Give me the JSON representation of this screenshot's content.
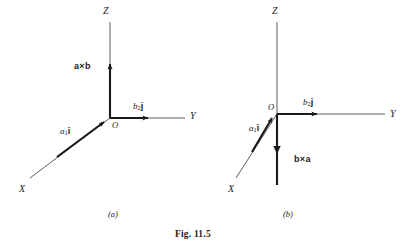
{
  "figure": {
    "caption": "Fig. 11.5",
    "caption_pos": {
      "x": 175,
      "y": 232
    },
    "panels": [
      {
        "id": "a",
        "label": "(a)",
        "label_pos": {
          "x": 108,
          "y": 210
        },
        "origin": {
          "x": 110,
          "y": 118
        },
        "origin_label": "O",
        "origin_label_pos": {
          "x": 112,
          "y": 121
        },
        "axes": [
          {
            "name": "z-axis",
            "label": "Z",
            "label_pos": {
              "x": 103,
              "y": 6
            },
            "line": {
              "x1": 110,
              "y1": 118,
              "x2": 110,
              "y2": 22
            }
          },
          {
            "name": "y-axis",
            "label": "Y",
            "label_pos": {
              "x": 190,
              "y": 111
            },
            "line": {
              "x1": 110,
              "y1": 118,
              "x2": 185,
              "y2": 118
            }
          },
          {
            "name": "x-axis",
            "label": "X",
            "label_pos": {
              "x": 19,
              "y": 184
            },
            "line": {
              "x1": 110,
              "y1": 118,
              "x2": 30,
              "y2": 178
            }
          }
        ],
        "vectors": [
          {
            "name": "a-cross-b",
            "label": "a×b",
            "label_text": "a",
            "label_op": "×",
            "label_text2": "b",
            "label_pos": {
              "x": 74,
              "y": 62
            },
            "line": {
              "x1": 110,
              "y1": 118,
              "x2": 110,
              "y2": 60
            },
            "direction": "up"
          },
          {
            "name": "a1i-component",
            "label": "a₁i",
            "coef": "a",
            "sub": "1",
            "unit": "i",
            "label_pos": {
              "x": 60,
              "y": 127
            },
            "line": {
              "x1": 110,
              "y1": 118,
              "x2": 57,
              "y2": 157
            },
            "direction": "down-left"
          },
          {
            "name": "b2j-component",
            "label": "b₂j",
            "coef": "b",
            "sub": "2",
            "unit": "j",
            "label_pos": {
              "x": 133,
              "y": 102
            },
            "line": {
              "x1": 110,
              "y1": 118,
              "x2": 152,
              "y2": 118
            },
            "direction": "right"
          }
        ]
      },
      {
        "id": "b",
        "label": "(b)",
        "label_pos": {
          "x": 283,
          "y": 210
        },
        "origin": {
          "x": 277,
          "y": 114
        },
        "origin_label": "O",
        "origin_label_pos": {
          "x": 270,
          "y": 104
        },
        "axes": [
          {
            "name": "z-axis",
            "label": "Z",
            "label_pos": {
              "x": 272,
              "y": 6
            },
            "line": {
              "x1": 277,
              "y1": 114,
              "x2": 277,
              "y2": 22
            }
          },
          {
            "name": "y-axis",
            "label": "Y",
            "label_pos": {
              "x": 390,
              "y": 109
            },
            "line": {
              "x1": 277,
              "y1": 114,
              "x2": 385,
              "y2": 114
            }
          },
          {
            "name": "x-axis",
            "label": "X",
            "label_pos": {
              "x": 228,
              "y": 184
            },
            "line": {
              "x1": 277,
              "y1": 114,
              "x2": 236,
              "y2": 178
            }
          }
        ],
        "vectors": [
          {
            "name": "b-cross-a",
            "label": "b×a",
            "label_text": "b",
            "label_op": "×",
            "label_text2": "a",
            "label_pos": {
              "x": 294,
              "y": 155
            },
            "line": {
              "x1": 277,
              "y1": 114,
              "x2": 277,
              "y2": 185
            },
            "arrow_at": {
              "x": 277,
              "y": 152
            },
            "direction": "down"
          },
          {
            "name": "a1i-component",
            "label": "a₁i",
            "coef": "a",
            "sub": "1",
            "unit": "i",
            "label_pos": {
              "x": 250,
              "y": 125
            },
            "line": {
              "x1": 277,
              "y1": 114,
              "x2": 252,
              "y2": 152
            },
            "direction": "down-left"
          },
          {
            "name": "b2j-component",
            "label": "b₂j",
            "coef": "b",
            "sub": "2",
            "unit": "j",
            "label_pos": {
              "x": 303,
              "y": 98
            },
            "line": {
              "x1": 277,
              "y1": 114,
              "x2": 320,
              "y2": 114
            },
            "direction": "right"
          }
        ]
      }
    ],
    "colors": {
      "ink": "#1a1a1a",
      "thin_line": "#4a4a4a",
      "background": "#ffffff"
    }
  }
}
